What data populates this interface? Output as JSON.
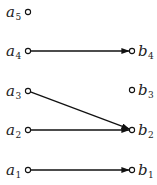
{
  "diagram": {
    "type": "bipartite-directed-graph",
    "left_nodes": [
      {
        "id": "a5",
        "base": "a",
        "sub": "5",
        "x": 28,
        "y": 12
      },
      {
        "id": "a4",
        "base": "a",
        "sub": "4",
        "x": 28,
        "y": 51
      },
      {
        "id": "a3",
        "base": "a",
        "sub": "3",
        "x": 28,
        "y": 91
      },
      {
        "id": "a2",
        "base": "a",
        "sub": "2",
        "x": 28,
        "y": 130
      },
      {
        "id": "a1",
        "base": "a",
        "sub": "1",
        "x": 28,
        "y": 170
      }
    ],
    "right_nodes": [
      {
        "id": "b4",
        "base": "b",
        "sub": "4",
        "x": 132,
        "y": 51
      },
      {
        "id": "b3",
        "base": "b",
        "sub": "3",
        "x": 132,
        "y": 90
      },
      {
        "id": "b2",
        "base": "b",
        "sub": "2",
        "x": 132,
        "y": 130
      },
      {
        "id": "b1",
        "base": "b",
        "sub": "1",
        "x": 132,
        "y": 170
      }
    ],
    "edges": [
      {
        "from": "a4",
        "to": "b4"
      },
      {
        "from": "a3",
        "to": "b2"
      },
      {
        "from": "a2",
        "to": "b2"
      },
      {
        "from": "a1",
        "to": "b1"
      }
    ],
    "colors": {
      "line": "#111111",
      "text": "#222222",
      "background": "#ffffff"
    }
  }
}
